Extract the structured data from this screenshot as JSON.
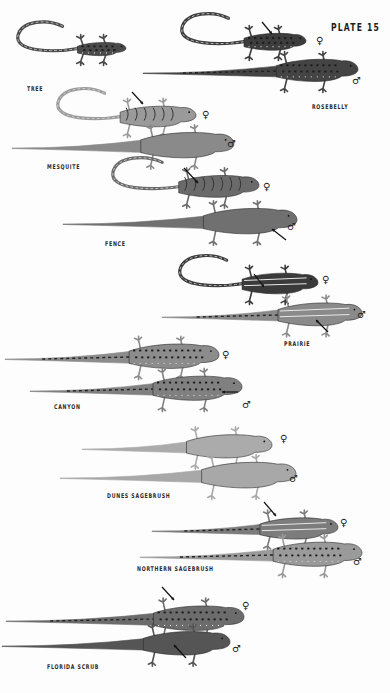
{
  "plate": {
    "title": "PLATE 15",
    "background": "#fdfdfd",
    "symbols": {
      "female": "♀",
      "male": "♂"
    }
  },
  "species": [
    {
      "name": "TREE",
      "label_pos": [
        27,
        85
      ],
      "lizards": [
        {
          "sex": "",
          "shade": "#4a4a4a",
          "pattern": "spotted",
          "x": 18,
          "y": 50,
          "len": 108,
          "body": 0.45,
          "tail_curl": true,
          "dir": 1
        }
      ]
    },
    {
      "name": "ROSEBELLY",
      "label_pos": [
        312,
        103
      ],
      "lizards": [
        {
          "sex": "female",
          "shade": "#3d3d3d",
          "pattern": "spotted",
          "x": 182,
          "y": 43,
          "len": 124,
          "body": 0.5,
          "tail_curl": true,
          "dir": 1,
          "sym": [
            316,
            36
          ],
          "arrow": [
            262,
            22,
            272,
            34
          ]
        },
        {
          "sex": "male",
          "shade": "#444",
          "pattern": "spotted",
          "x": 143,
          "y": 72,
          "len": 215,
          "body": 0.38,
          "tail_curl": false,
          "dir": 1,
          "sym": [
            352,
            76
          ]
        }
      ]
    },
    {
      "name": "MESQUITE",
      "label_pos": [
        47,
        163
      ],
      "lizards": [
        {
          "sex": "female",
          "shade": "#9a9a9a",
          "pattern": "bands",
          "x": 58,
          "y": 118,
          "len": 138,
          "body": 0.55,
          "tail_curl": true,
          "dir": 1,
          "sym": [
            202,
            110
          ],
          "arrow": [
            132,
            92,
            143,
            104
          ]
        },
        {
          "sex": "male",
          "shade": "#8a8a8a",
          "pattern": "plain",
          "x": 12,
          "y": 147,
          "len": 222,
          "body": 0.42,
          "tail_curl": false,
          "dir": 1,
          "sym": [
            227,
            139
          ]
        }
      ]
    },
    {
      "name": "FENCE",
      "label_pos": [
        105,
        240
      ],
      "lizards": [
        {
          "sex": "female",
          "shade": "#6a6a6a",
          "pattern": "bands",
          "x": 113,
          "y": 188,
          "len": 146,
          "body": 0.55,
          "tail_curl": true,
          "dir": 1,
          "sym": [
            263,
            182
          ],
          "arrow": [
            184,
            168,
            198,
            183
          ]
        },
        {
          "sex": "male",
          "shade": "#707070",
          "pattern": "plain",
          "x": 63,
          "y": 223,
          "len": 234,
          "body": 0.4,
          "tail_curl": false,
          "dir": 1,
          "sym": [
            287,
            222
          ],
          "arrow": [
            286,
            240,
            272,
            229
          ]
        }
      ]
    },
    {
      "name": "PRAIRIE",
      "label_pos": [
        284,
        340
      ],
      "lizards": [
        {
          "sex": "female",
          "shade": "#3a3a3a",
          "pattern": "stripes",
          "x": 180,
          "y": 285,
          "len": 138,
          "body": 0.55,
          "tail_curl": true,
          "dir": 1,
          "sym": [
            322,
            275
          ],
          "arrow": [
            254,
            274,
            264,
            287
          ]
        },
        {
          "sex": "male",
          "shade": "#8a8a8a",
          "pattern": "stripes",
          "x": 162,
          "y": 316,
          "len": 200,
          "body": 0.42,
          "tail_curl": false,
          "dir": 1,
          "sym": [
            357,
            310
          ],
          "arrow": [
            328,
            332,
            316,
            320
          ]
        }
      ]
    },
    {
      "name": "CANYON",
      "label_pos": [
        54,
        403
      ],
      "lizards": [
        {
          "sex": "female",
          "shade": "#8c8c8c",
          "pattern": "spotted",
          "x": 5,
          "y": 358,
          "len": 214,
          "body": 0.42,
          "tail_curl": false,
          "dir": 1,
          "sym": [
            222,
            350
          ]
        },
        {
          "sex": "male",
          "shade": "#808080",
          "pattern": "spotted",
          "x": 30,
          "y": 390,
          "len": 212,
          "body": 0.42,
          "tail_curl": false,
          "dir": 1,
          "sym": [
            242,
            400
          ],
          "arrow": [
            238,
            392,
            222,
            392
          ]
        }
      ]
    },
    {
      "name": "DUNES SAGEBRUSH",
      "label_pos": [
        107,
        492
      ],
      "lizards": [
        {
          "sex": "female",
          "shade": "#ababab",
          "pattern": "plain",
          "x": 82,
          "y": 448,
          "len": 190,
          "body": 0.45,
          "tail_curl": false,
          "dir": 1,
          "sym": [
            280,
            434
          ]
        },
        {
          "sex": "male",
          "shade": "#a8a8a8",
          "pattern": "plain",
          "x": 60,
          "y": 477,
          "len": 236,
          "body": 0.4,
          "tail_curl": false,
          "dir": 1,
          "sym": [
            289,
            474
          ]
        }
      ]
    },
    {
      "name": "NORTHERN SAGEBRUSH",
      "label_pos": [
        137,
        565
      ],
      "lizards": [
        {
          "sex": "female",
          "shade": "#7c7c7c",
          "pattern": "stripes",
          "x": 152,
          "y": 530,
          "len": 186,
          "body": 0.42,
          "tail_curl": false,
          "dir": 1,
          "sym": [
            340,
            518
          ],
          "arrow": [
            264,
            502,
            276,
            516
          ]
        },
        {
          "sex": "male",
          "shade": "#9a9a9a",
          "pattern": "spotted",
          "x": 140,
          "y": 556,
          "len": 222,
          "body": 0.4,
          "tail_curl": false,
          "dir": 1,
          "sym": [
            353,
            557
          ]
        }
      ]
    },
    {
      "name": "FLORIDA SCRUB",
      "label_pos": [
        47,
        663
      ],
      "lizards": [
        {
          "sex": "female",
          "shade": "#6c6c6c",
          "pattern": "spotted",
          "x": 6,
          "y": 620,
          "len": 238,
          "body": 0.38,
          "tail_curl": false,
          "dir": 1,
          "sym": [
            242,
            601
          ],
          "arrow": [
            162,
            587,
            174,
            600
          ]
        },
        {
          "sex": "male",
          "shade": "#555555",
          "pattern": "plain",
          "x": 2,
          "y": 645,
          "len": 228,
          "body": 0.38,
          "tail_curl": false,
          "dir": 1,
          "sym": [
            232,
            644
          ],
          "arrow": [
            186,
            658,
            174,
            645
          ]
        }
      ]
    }
  ]
}
